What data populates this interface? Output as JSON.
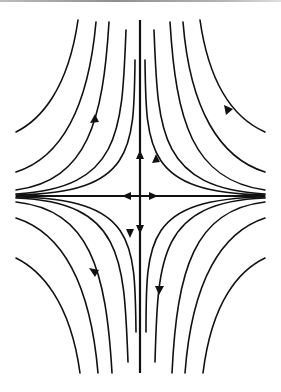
{
  "diagram": {
    "type": "phase-portrait",
    "colors": {
      "stroke": "#111111",
      "background": "#ffffff",
      "top_rule": "#9a9a9a"
    },
    "center": {
      "x": 140,
      "y": 196
    },
    "axes": {
      "horizontal": {
        "x1": 16,
        "x2": 265,
        "y": 196
      },
      "vertical": {
        "x": 140,
        "y1": 20,
        "y2": 373
      }
    },
    "arrows": [
      {
        "x": 140,
        "y": 156,
        "dir": "up"
      },
      {
        "x": 140,
        "y": 229,
        "dir": "down"
      },
      {
        "x": 127,
        "y": 196,
        "dir": "left"
      },
      {
        "x": 153,
        "y": 196,
        "dir": "right"
      },
      {
        "x": 93,
        "y": 119,
        "dir": "up"
      },
      {
        "x": 228,
        "y": 110,
        "dir": "up-left"
      },
      {
        "x": 93,
        "y": 272,
        "dir": "down"
      },
      {
        "x": 160,
        "y": 290,
        "dir": "down"
      },
      {
        "x": 155,
        "y": 160,
        "dir": "up"
      },
      {
        "x": 131,
        "y": 233,
        "dir": "down"
      }
    ]
  }
}
